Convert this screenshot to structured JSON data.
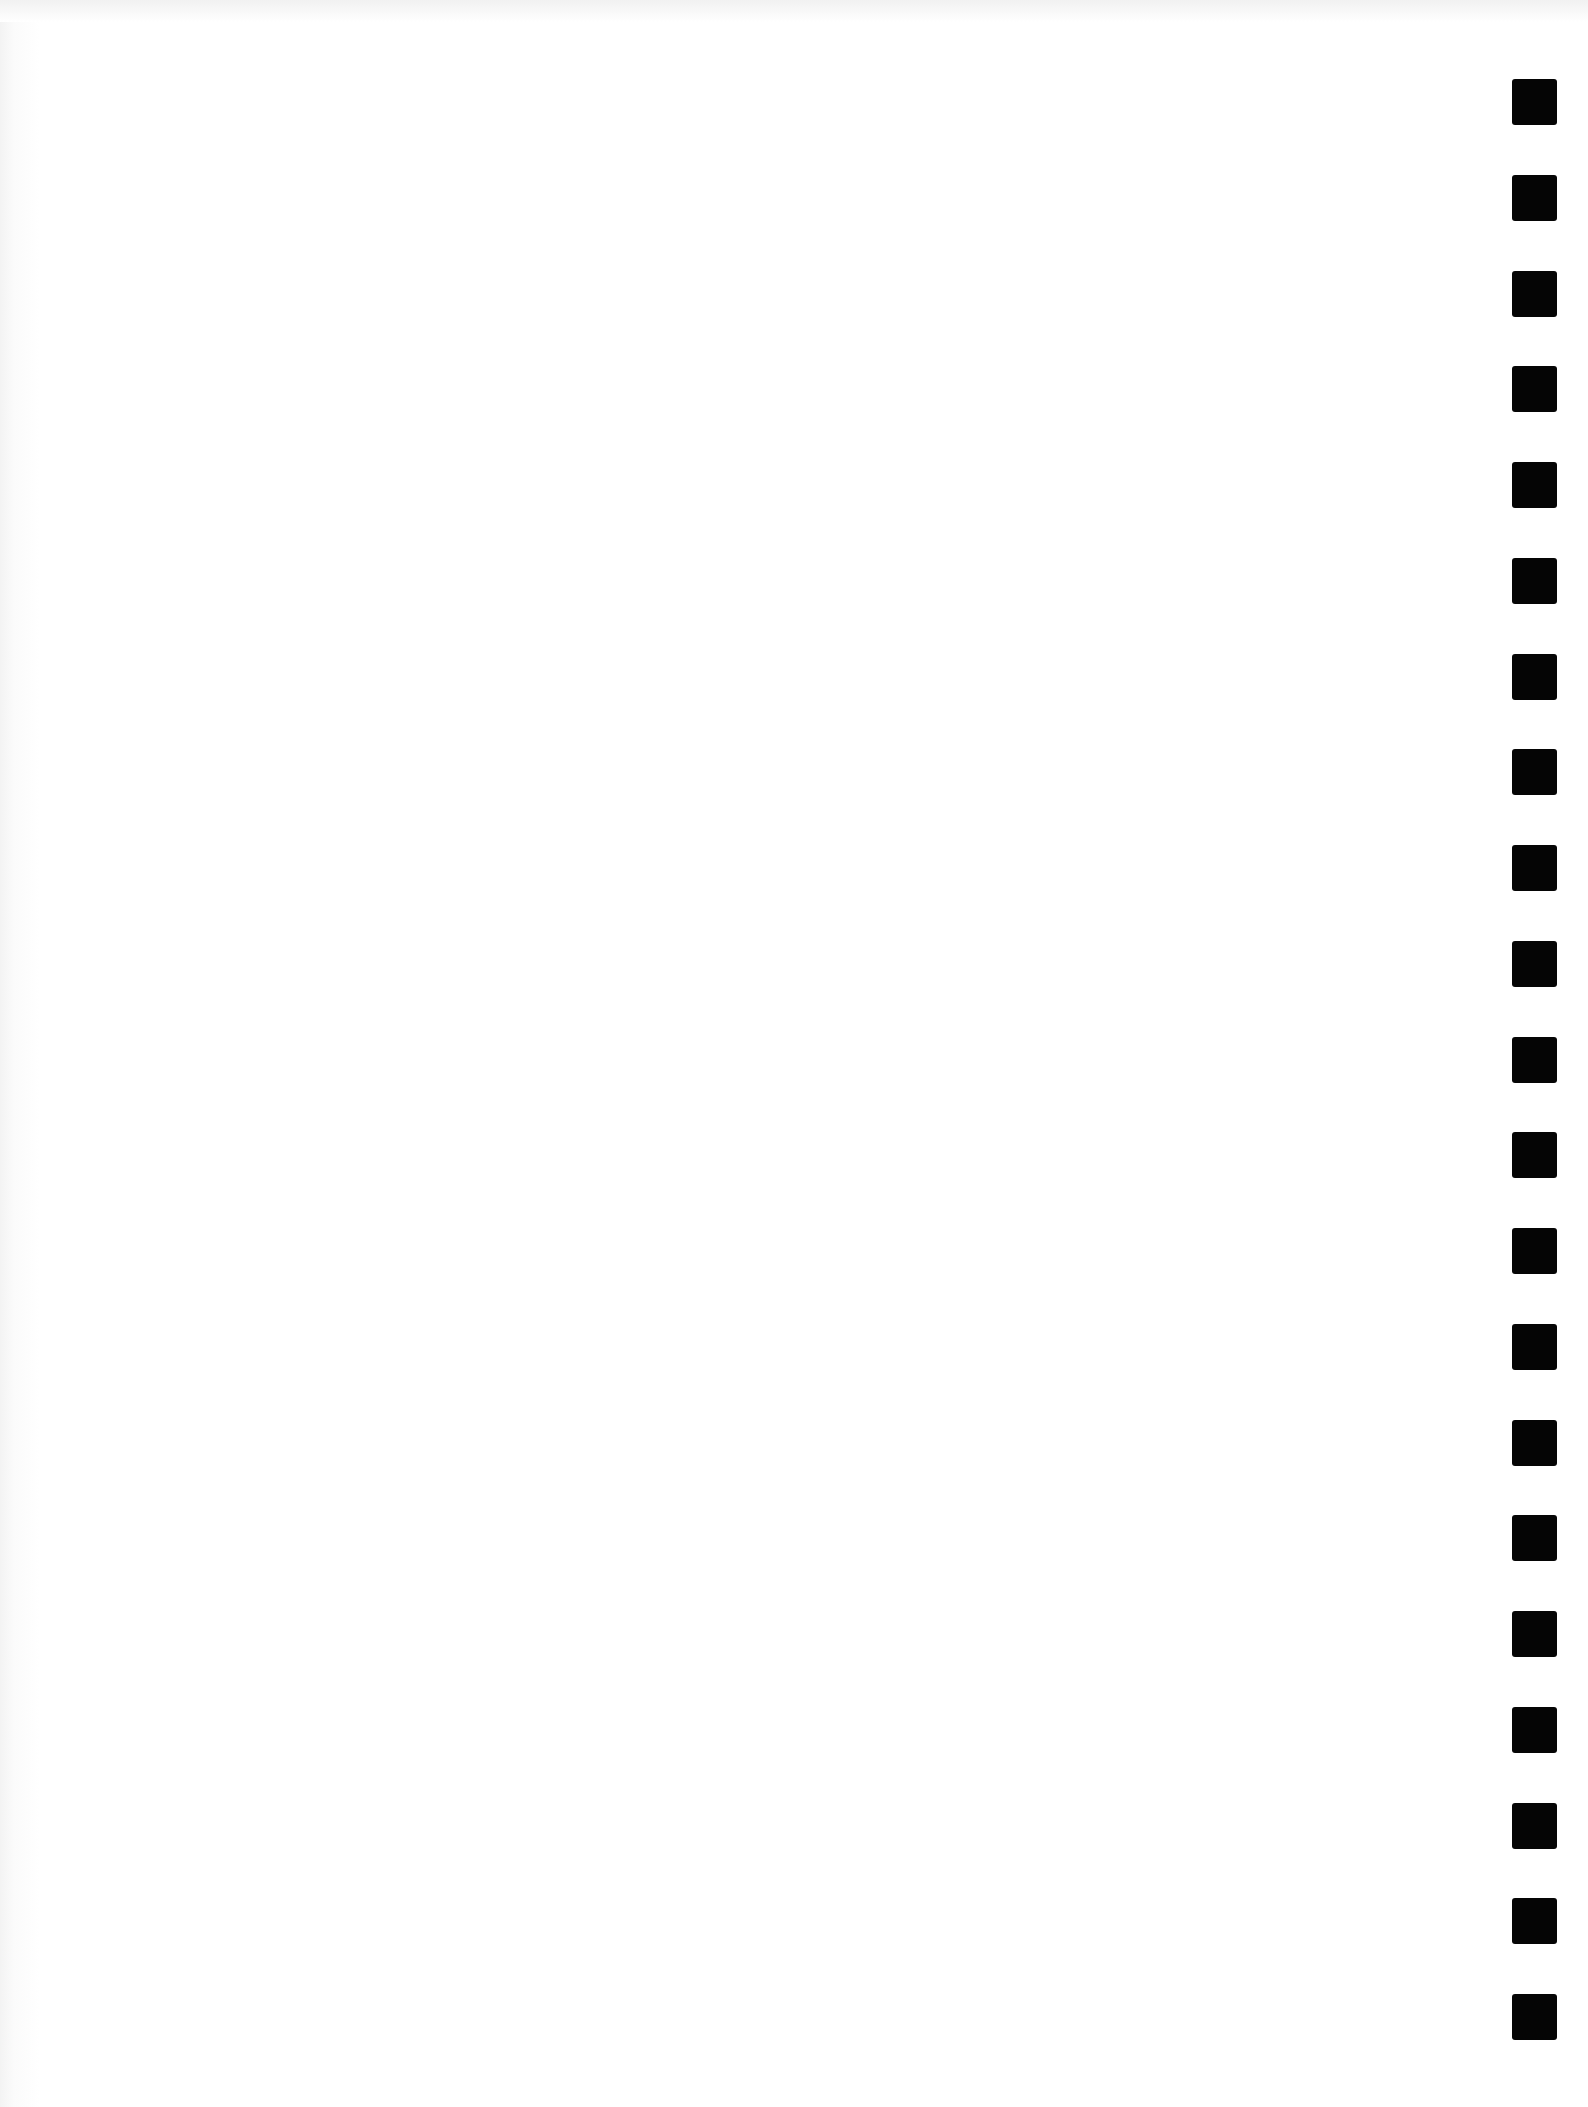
{
  "page": {
    "type": "blank scanned page",
    "background_color": "#ffffff",
    "content_text": ""
  },
  "binding_holes": {
    "count": 21,
    "side": "right",
    "color": "#050505",
    "x": 1512,
    "width": 45,
    "height": 46,
    "first_top": 79,
    "pitch": 95.75
  }
}
